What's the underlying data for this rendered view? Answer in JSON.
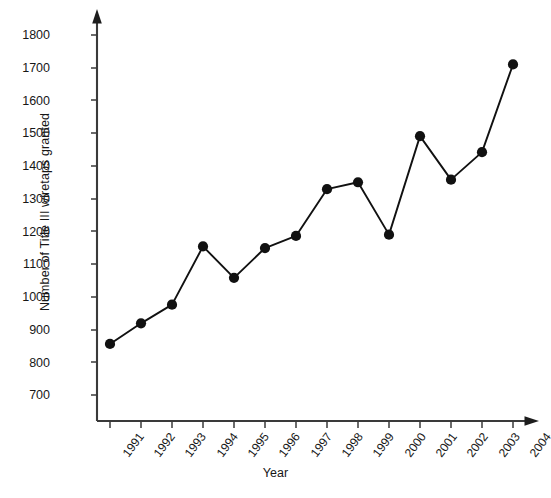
{
  "chart_data": {
    "type": "line",
    "title": "",
    "xlabel": "Year",
    "ylabel": "Number of Title III wiretaps granted",
    "categories": [
      "1991",
      "1992",
      "1993",
      "1994",
      "1995",
      "1996",
      "1997",
      "1998",
      "1999",
      "2000",
      "2001",
      "2002",
      "2003",
      "2004"
    ],
    "values": [
      856,
      919,
      976,
      1154,
      1058,
      1149,
      1186,
      1329,
      1350,
      1190,
      1491,
      1358,
      1442,
      1710
    ],
    "series": [
      {
        "name": "Title III wiretaps granted",
        "values": [
          856,
          919,
          976,
          1154,
          1058,
          1149,
          1186,
          1329,
          1350,
          1190,
          1491,
          1358,
          1442,
          1710
        ]
      }
    ],
    "ytick_labels": [
      "1800",
      "1700",
      "1600",
      "1500",
      "1400",
      "1300",
      "1200",
      "1100",
      "1000",
      "900",
      "800",
      "700"
    ],
    "ytick_values": [
      1800,
      1700,
      1600,
      1500,
      1400,
      1300,
      1200,
      1100,
      1000,
      900,
      800,
      700
    ],
    "ylim": [
      640,
      1845
    ],
    "xlim": [
      1990.4,
      2004.6
    ],
    "grid": false,
    "legend": null,
    "marker": "filled-circle",
    "line_color": "#111111",
    "marker_color": "#111111",
    "axis_color": "#3a3a3a",
    "background_color": "#ffffff"
  }
}
